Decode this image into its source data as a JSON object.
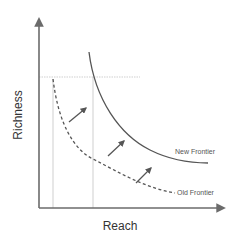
{
  "diagram": {
    "title": "",
    "x_axis": {
      "label": "Reach"
    },
    "y_axis": {
      "label": "Richness"
    },
    "curves": [
      {
        "name": "New Frontier",
        "style": "solid",
        "label": "New Frontier"
      },
      {
        "name": "Old Frontier",
        "style": "dashed",
        "label": "Old Frontier"
      }
    ],
    "reference_lines": [
      {
        "orientation": "horizontal",
        "style": "dotted"
      },
      {
        "orientation": "vertical",
        "style": "dotted"
      },
      {
        "orientation": "vertical",
        "style": "dotted"
      }
    ],
    "shift_arrows": {
      "count": 3,
      "direction": "up-right",
      "meaning": "frontier shift outward"
    },
    "colors": {
      "axis": "#6b6b6b",
      "curve": "#555555",
      "reference": "#cfcfcf",
      "arrow": "#555555",
      "text": "#333333"
    }
  }
}
